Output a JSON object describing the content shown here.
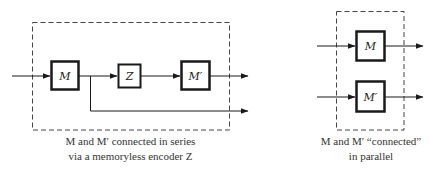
{
  "series_diagram": {
    "blocks": [
      {
        "id": "M",
        "label": "M"
      },
      {
        "id": "Z",
        "label": "Z"
      },
      {
        "id": "Mprime",
        "label": "M′"
      }
    ],
    "caption_line1": "M and M′ connected in series",
    "caption_line2": "via a memoryless encoder Z"
  },
  "parallel_diagram": {
    "blocks": [
      {
        "id": "M",
        "label": "M"
      },
      {
        "id": "Mprime",
        "label": "M′"
      }
    ],
    "caption_line1": "M and M′ “connected”",
    "caption_line2": "in parallel"
  },
  "colors": {
    "stroke": "#1a1a1a",
    "dashed": "#444444",
    "text": "#333333"
  }
}
